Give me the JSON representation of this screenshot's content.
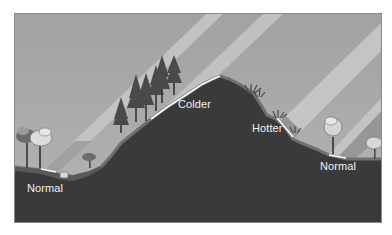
{
  "diagram": {
    "labels": {
      "left_valley": "Normal",
      "shaded_slope": "Colder",
      "sunny_slope": "Hotter",
      "right_valley": "Normal"
    },
    "elements": [
      {
        "name": "sky",
        "color": "#a9a9a9"
      },
      {
        "name": "sun-rays",
        "count": 4,
        "direction": "from upper right, diagonal"
      },
      {
        "name": "hill",
        "color": "#3b3b3b"
      },
      {
        "name": "conifer-trees",
        "location": "left (shaded) slope"
      },
      {
        "name": "shrubs",
        "location": "right (sunny) slope"
      },
      {
        "name": "deciduous-trees",
        "location": "left and right valleys"
      }
    ],
    "colors": {
      "sky": "#a9a9a9",
      "ray_light": "#c8c8c8",
      "ray_dark": "#8f8f8f",
      "hill": "#3b3b3b",
      "soil_edge": "#6e6e6e",
      "label_text": "#f2f2f2"
    }
  }
}
